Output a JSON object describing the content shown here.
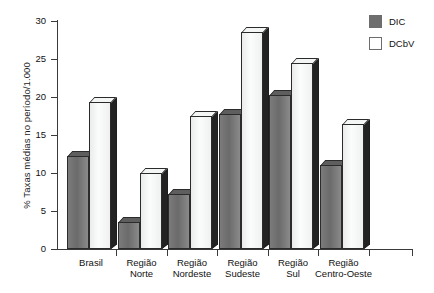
{
  "chart_data": {
    "type": "bar",
    "title": "",
    "xlabel": "",
    "ylabel": "% Taxas médias no período/1.000",
    "ylim": [
      0,
      30
    ],
    "ytick_labels": [
      "0",
      "5",
      "10",
      "15",
      "20",
      "25",
      "30"
    ],
    "yticks": [
      0,
      5,
      10,
      15,
      20,
      25,
      30
    ],
    "grid": false,
    "legend_position": "top-right",
    "categories": [
      "Brasil",
      "Região\nNorte",
      "Região\nNordeste",
      "Região\nSudeste",
      "Região\nSul",
      "Região\nCentro-Oeste"
    ],
    "series": [
      {
        "name": "DIC",
        "color": "#6e6e6e",
        "values": [
          12.3,
          3.5,
          7.3,
          17.8,
          20.2,
          11.0
        ]
      },
      {
        "name": "DCbV",
        "color": "#ffffff",
        "values": [
          19.3,
          10.0,
          17.5,
          28.5,
          24.5,
          16.5
        ]
      }
    ]
  },
  "legend": {
    "items": [
      {
        "label": "DIC",
        "swatch": "dic"
      },
      {
        "label": "DCbV",
        "swatch": "dcbv"
      }
    ]
  }
}
